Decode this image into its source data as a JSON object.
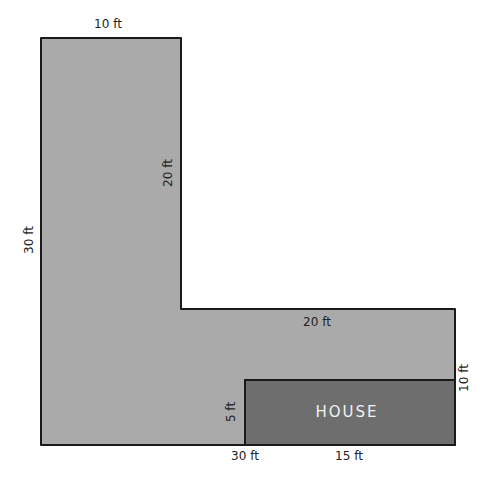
{
  "diagram": {
    "type": "floor-plan",
    "colors": {
      "yard_fill": "#aaaaaa",
      "house_fill": "#6e6e6e",
      "outline": "#1a1a1a",
      "label_text": "#222222",
      "house_text": "#f2f2f2",
      "background": "#ffffff"
    },
    "shapes": {
      "yard": {
        "name": "L-shaped yard"
      },
      "house": {
        "label": "HOUSE"
      }
    },
    "labels": {
      "top_width": "10 ft",
      "inner_vertical": "20 ft",
      "left_height": "30 ft",
      "inner_horizontal": "20 ft",
      "right_height": "10 ft",
      "house_height": "5 ft",
      "bottom_left": "30 ft",
      "house_width": "15 ft"
    }
  }
}
